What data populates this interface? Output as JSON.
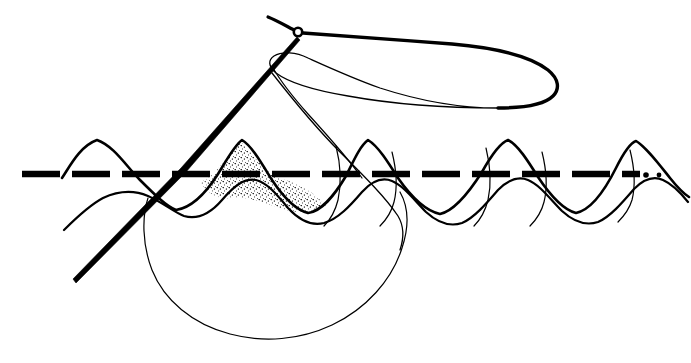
{
  "figure": {
    "width": 691,
    "height": 363,
    "background_color": "#ffffff",
    "ink_color": "#000000",
    "style": "pen-and-ink line drawing"
  },
  "elements": {
    "needle": {
      "name": "sewing-needle",
      "eye_center": {
        "x": 298,
        "y": 32
      },
      "eye_radius": 4.2,
      "shaft_start": {
        "x": 296,
        "y": 37
      },
      "shaft_mid": {
        "x": 183,
        "y": 168
      },
      "tip_end": {
        "x": 74,
        "y": 281
      },
      "shaft_width_top": 5.2,
      "shaft_width_tip": 2.0,
      "color": "#000000"
    },
    "thread_upper_loop": {
      "name": "thread-upper-loop",
      "description": "Thread leaving the needle eye, looping right and returning",
      "stroke_width_thick": 3.4,
      "stroke_width_thin": 1.3,
      "color": "#000000",
      "tail_start": {
        "x": 268,
        "y": 18
      },
      "loop_right_extent": {
        "x": 560,
        "y": 90
      },
      "loop_left_return": {
        "x": 272,
        "y": 72
      }
    },
    "thread_lower_loop": {
      "name": "thread-lower-loop",
      "description": "Slack thread loop hanging below the fabric",
      "stroke_width": 1.2,
      "color": "#000000",
      "top_left": {
        "x": 150,
        "y": 205
      },
      "bottom": {
        "x": 290,
        "y": 330
      },
      "top_right": {
        "x": 405,
        "y": 200
      }
    },
    "fabric": {
      "name": "fabric-wave-profile",
      "description": "Undulating fabric cross-section drawn as two offset wavy lines",
      "upper_line_color": "#000000",
      "upper_line_width": 2.6,
      "lower_line_color": "#000000",
      "lower_line_width": 2.2,
      "baseline_y": 174,
      "crest_y": 140,
      "trough_y": 212,
      "crest_x_positions": [
        95,
        240,
        365,
        505,
        620
      ],
      "trough_x_positions": [
        170,
        300,
        440,
        570
      ],
      "left_edge_x": 62,
      "right_edge_x": 688
    },
    "stitch_line": {
      "name": "stitch-dashed-line",
      "description": "Heavy dashed line marking the seam along the fabric",
      "y": 174,
      "start_x": 22,
      "end_x": 662,
      "dash_length": 38,
      "gap_length": 12,
      "stroke_width": 6.5,
      "color": "#000000",
      "end_dot_positions": [
        646,
        659
      ],
      "end_dot_size": 3
    },
    "stitch_marks": {
      "name": "stitch-cross-marks",
      "description": "Thin arcs crossing the fabric where thread passes through",
      "x_positions": [
        340,
        395,
        490,
        545,
        634
      ],
      "stroke_width": 1.2,
      "color": "#000000"
    },
    "shading": {
      "name": "stipple-shading",
      "description": "Dotted stipple texture inside the second fabric crest",
      "region_x_start": 205,
      "region_x_end": 335,
      "region_y_top": 142,
      "region_y_bottom": 214,
      "dot_color": "#000000",
      "dot_radius": 0.55,
      "density": 420
    }
  },
  "labels": {
    "alt_text": "Ink line drawing of a threaded sewing needle piercing a wavy piece of fabric along a heavy dashed seam line, with a loose thread loop hanging below and a long thread loop above."
  }
}
